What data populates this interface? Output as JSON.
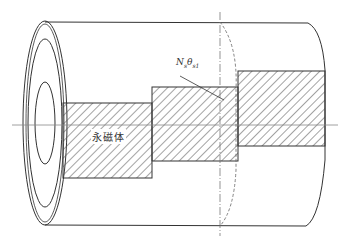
{
  "diagram": {
    "title": "",
    "labels": {
      "winding_symbol_main": "N",
      "winding_symbol_sub1": "s",
      "angle_symbol_main": "θ",
      "angle_symbol_sub": "s1",
      "magnet_label": "永磁体"
    },
    "colors": {
      "line": "#333333",
      "hatch": "#555555",
      "background": "#ffffff"
    },
    "components": [
      {
        "name": "outer-cylinder",
        "description": "cylindrical stator/sleeve"
      },
      {
        "name": "permanent-magnet-segment-1"
      },
      {
        "name": "permanent-magnet-segment-2"
      },
      {
        "name": "permanent-magnet-segment-3"
      },
      {
        "name": "central-axis"
      },
      {
        "name": "section-plane-line"
      }
    ]
  }
}
